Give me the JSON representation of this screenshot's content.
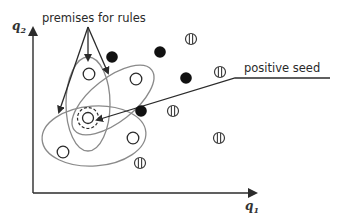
{
  "diagram": {
    "axes": {
      "x_label": "q",
      "x_sub": "1",
      "y_label": "q",
      "y_sub": "2",
      "origin": [
        33,
        193
      ],
      "x_end": [
        257,
        193
      ],
      "y_end": [
        33,
        27
      ]
    },
    "annotations": {
      "premises_label": "premises for rules",
      "seed_label": "positive seed"
    },
    "colors": {
      "ink": "#2b2b2b",
      "ellipse": "#808080",
      "background": "#ffffff"
    },
    "positive_seed": {
      "x": 88,
      "y": 118
    },
    "open_points": [
      {
        "x": 89,
        "y": 74
      },
      {
        "x": 136,
        "y": 79
      },
      {
        "x": 133,
        "y": 138
      },
      {
        "x": 63,
        "y": 152
      }
    ],
    "filled_points": [
      {
        "x": 112,
        "y": 57
      },
      {
        "x": 160,
        "y": 52
      },
      {
        "x": 186,
        "y": 78
      },
      {
        "x": 141,
        "y": 111
      }
    ],
    "hatched_points": [
      {
        "x": 191,
        "y": 39
      },
      {
        "x": 220,
        "y": 72
      },
      {
        "x": 173,
        "y": 111
      },
      {
        "x": 219,
        "y": 138
      },
      {
        "x": 140,
        "y": 163
      }
    ],
    "legend": {
      "open": "premise covered example",
      "filled": "negative example",
      "hatched": "uncovered example"
    }
  }
}
